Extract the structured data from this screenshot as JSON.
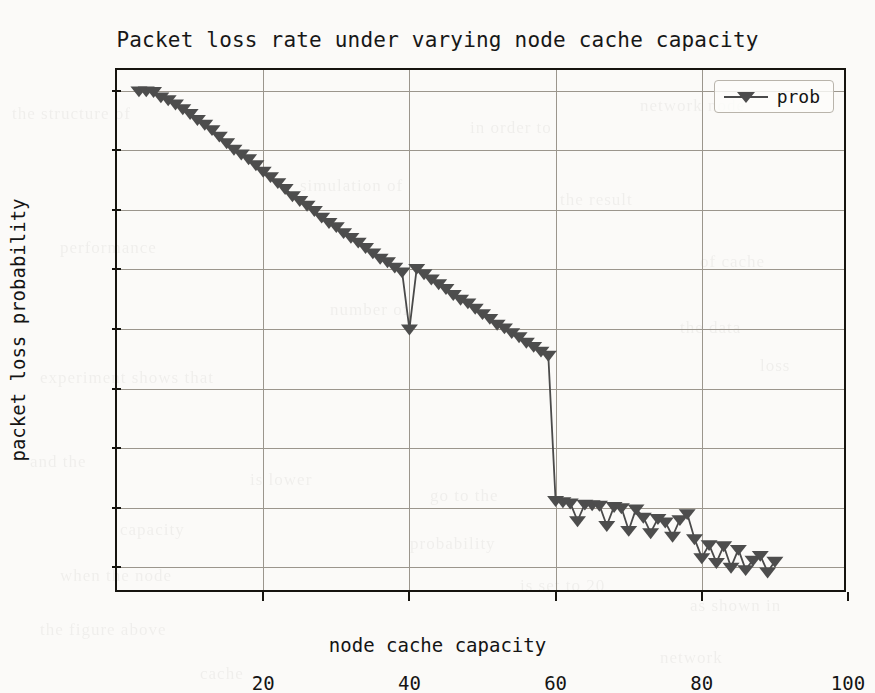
{
  "chart_data": {
    "type": "line",
    "title": "Packet loss rate under varying node cache capacity",
    "xlabel": "node cache capacity",
    "ylabel": "packet loss probability",
    "xlim": [
      0,
      100
    ],
    "ylim": [
      0.7355,
      0.8235
    ],
    "grid": true,
    "legend_position": "upper right",
    "xticks": [
      20,
      40,
      60,
      80,
      100
    ],
    "xtick_labels": [
      "20",
      "40",
      "60",
      "80",
      "100"
    ],
    "yticks": [
      0.74,
      0.75,
      0.76,
      0.77,
      0.78,
      0.79,
      0.8,
      0.81,
      0.82
    ],
    "ytick_labels": [
      "0.74",
      "0.75",
      "0.76",
      "0.77",
      "0.78",
      "0.79",
      "0.80",
      "0.81",
      "0.82"
    ],
    "marker": "triangle-down",
    "marker_color": "#4d4d4d",
    "line_color": "#4a4a4a",
    "series": [
      {
        "name": "prob",
        "x": [
          3,
          4,
          5,
          6,
          7,
          8,
          9,
          10,
          11,
          12,
          13,
          14,
          15,
          16,
          17,
          18,
          19,
          20,
          21,
          22,
          23,
          24,
          25,
          26,
          27,
          28,
          29,
          30,
          31,
          32,
          33,
          34,
          35,
          36,
          37,
          38,
          39,
          40,
          41,
          42,
          43,
          44,
          45,
          46,
          47,
          48,
          49,
          50,
          51,
          52,
          53,
          54,
          55,
          56,
          57,
          58,
          59,
          60,
          61,
          62,
          63,
          64,
          65,
          66,
          67,
          68,
          69,
          70,
          71,
          72,
          73,
          74,
          75,
          76,
          77,
          78,
          79,
          80,
          81,
          82,
          83,
          84,
          85,
          86,
          87,
          88,
          89
        ],
        "values": [
          0.82,
          0.82,
          0.8199,
          0.819,
          0.8185,
          0.8178,
          0.817,
          0.8162,
          0.8152,
          0.8144,
          0.8135,
          0.8124,
          0.8113,
          0.8102,
          0.8094,
          0.8086,
          0.8076,
          0.8065,
          0.8056,
          0.8046,
          0.8036,
          0.8024,
          0.8016,
          0.8008,
          0.7999,
          0.7988,
          0.7979,
          0.7972,
          0.7962,
          0.7954,
          0.7946,
          0.7937,
          0.7928,
          0.7919,
          0.7913,
          0.7904,
          0.7896,
          0.78,
          0.7902,
          0.7893,
          0.7884,
          0.7876,
          0.7868,
          0.7858,
          0.785,
          0.7844,
          0.7835,
          0.7826,
          0.7818,
          0.7808,
          0.7802,
          0.7794,
          0.7787,
          0.7778,
          0.7771,
          0.7763,
          0.7756,
          0.7748,
          0.7742,
          0.7736,
          0.7728,
          0.7722,
          0.7714,
          0.7722,
          0.7706,
          0.77,
          0.77,
          0.77,
          0.7692,
          0.7682,
          0.7672,
          0.7663,
          0.7656,
          0.7674,
          0.765,
          0.7642,
          0.7634,
          0.7646,
          0.7636,
          0.7628,
          0.7622,
          0.7616,
          0.761,
          0.7604,
          0.76,
          0.76,
          0.76
        ],
        "x2": [
          60,
          61,
          62,
          63,
          64,
          65,
          66,
          67,
          68,
          69,
          70,
          71,
          72,
          73,
          74,
          75,
          76,
          77,
          78,
          79,
          80,
          81,
          82,
          83,
          84,
          85,
          86,
          87,
          88,
          89,
          90
        ],
        "values2": [
          0.7512,
          0.751,
          0.7508,
          0.7478,
          0.7506,
          0.7505,
          0.7504,
          0.747,
          0.7502,
          0.75,
          0.7462,
          0.7498,
          0.7484,
          0.7458,
          0.7482,
          0.7476,
          0.7452,
          0.748,
          0.749,
          0.7448,
          0.7416,
          0.7438,
          0.7408,
          0.7436,
          0.74,
          0.743,
          0.7396,
          0.7412,
          0.742,
          0.7392,
          0.741
        ]
      }
    ]
  },
  "legend": {
    "entries": [
      {
        "label": "prob"
      }
    ]
  },
  "bleed_text": [
    {
      "t": "the structure of",
      "x": 12,
      "y": 104
    },
    {
      "t": "in order to",
      "x": 470,
      "y": 118
    },
    {
      "t": "network node",
      "x": 640,
      "y": 96
    },
    {
      "t": "simulation of",
      "x": 300,
      "y": 176
    },
    {
      "t": "the result",
      "x": 560,
      "y": 190
    },
    {
      "t": "performance",
      "x": 60,
      "y": 238
    },
    {
      "t": "of cache",
      "x": 700,
      "y": 252
    },
    {
      "t": "number of",
      "x": 330,
      "y": 300
    },
    {
      "t": "the data",
      "x": 680,
      "y": 318
    },
    {
      "t": "experiment shows that",
      "x": 40,
      "y": 368
    },
    {
      "t": "loss",
      "x": 760,
      "y": 356
    },
    {
      "t": "and the",
      "x": 30,
      "y": 452
    },
    {
      "t": "is lower",
      "x": 250,
      "y": 470
    },
    {
      "t": "go to the",
      "x": 430,
      "y": 486
    },
    {
      "t": "capacity",
      "x": 120,
      "y": 520
    },
    {
      "t": "probability",
      "x": 410,
      "y": 534
    },
    {
      "t": "when the node",
      "x": 60,
      "y": 566
    },
    {
      "t": "is set to 20",
      "x": 520,
      "y": 576
    },
    {
      "t": "as shown in",
      "x": 690,
      "y": 596
    },
    {
      "t": "the figure above",
      "x": 40,
      "y": 620
    },
    {
      "t": "network",
      "x": 660,
      "y": 648
    },
    {
      "t": "cache",
      "x": 200,
      "y": 664
    }
  ]
}
